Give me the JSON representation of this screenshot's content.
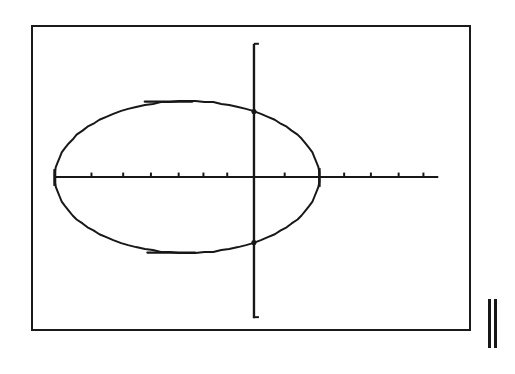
{
  "screen": {
    "device": "graphing-calculator",
    "frame_color": "#1a1a1a",
    "background_color": "#ffffff",
    "plot_color": "#171717",
    "border_width_px": 2
  },
  "glyph": {
    "name": "pause-bars-glyph",
    "label": "||",
    "bar_count": 2,
    "color": "#171717"
  },
  "chart_data": {
    "type": "line",
    "title": "",
    "subtitle": "",
    "xlabel": "",
    "ylabel": "",
    "grid": false,
    "legend": null,
    "axes": {
      "x_axis": {
        "visible": true,
        "y_position_px": 177,
        "start_px": 53,
        "end_px": 440,
        "tick_marks_px": [
          90,
          122,
          150,
          178,
          203,
          227,
          285,
          345,
          372,
          400,
          425
        ],
        "tick_labels": [],
        "tick_direction": "up"
      },
      "y_axis": {
        "visible": true,
        "x_position_px": 254,
        "start_px": 42,
        "end_px": 320,
        "tick_marks_px": [
          42,
          320
        ],
        "tick_labels": [],
        "tick_direction": "right"
      }
    },
    "xlim": [
      -6.7,
      9.3
    ],
    "ylim": [
      -5.0,
      5.0
    ],
    "series": [
      {
        "name": "ellipse",
        "shape": "ellipse",
        "center": {
          "x": -1.2,
          "y": 0.0
        },
        "semi_major_axis_x": 5.5,
        "semi_minor_axis_y": 2.8,
        "center_px": {
          "x": 186.5,
          "y": 177.0
        },
        "radius_px": {
          "rx": 133.5,
          "ry": 77.0
        },
        "closed": true,
        "stroke_width_px": 2,
        "x_extent_px": [
          53,
          320
        ],
        "y_extent_px": [
          100,
          254
        ]
      }
    ],
    "annotations": []
  }
}
